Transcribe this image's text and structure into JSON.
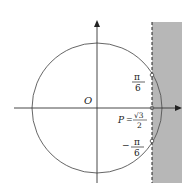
{
  "diagram": {
    "type": "unit-circle",
    "labels": {
      "origin": "O",
      "angle_pos": {
        "num": "π",
        "den": "6"
      },
      "angle_neg": {
        "sign": "−",
        "num": "π",
        "den": "6"
      },
      "point": {
        "name": "P",
        "eq": "=",
        "num": "√3",
        "den": "2"
      }
    },
    "colors": {
      "stroke": "#444444",
      "shade": "#b4b4b4",
      "background": "#ffffff"
    }
  }
}
